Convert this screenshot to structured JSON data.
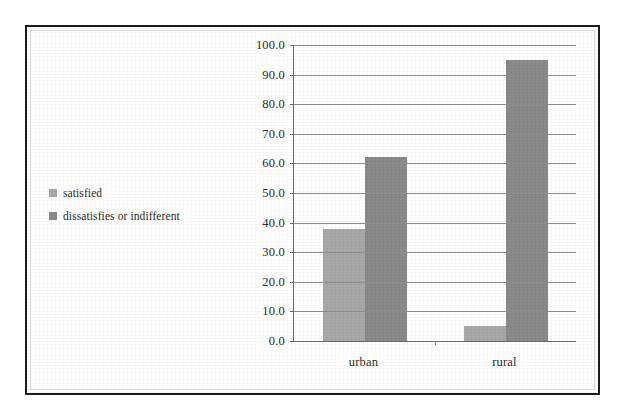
{
  "chart_data": {
    "type": "bar",
    "title": "",
    "subtitle": "",
    "xlabel": "",
    "ylabel": "",
    "categories": [
      "urban",
      "rural"
    ],
    "series": [
      {
        "name": "satisfied",
        "values": [
          38.0,
          5.0
        ],
        "color": "#a8a8a8"
      },
      {
        "name": "dissatisfies or indifferent",
        "values": [
          62.0,
          95.0
        ],
        "color": "#8a8a8a"
      }
    ],
    "ylim": [
      0.0,
      100.0
    ],
    "ytick_step": 10.0,
    "ytick_labels": [
      "100.0",
      "90.0",
      "80.0",
      "70.0",
      "60.0",
      "50.0",
      "40.0",
      "30.0",
      "20.0",
      "10.0",
      "0.0"
    ],
    "ytick_values": [
      100.0,
      90.0,
      80.0,
      70.0,
      60.0,
      50.0,
      40.0,
      30.0,
      20.0,
      10.0,
      0.0
    ],
    "grid": true,
    "grid_axis": "y",
    "legend_position": "left",
    "annotations": []
  },
  "legend": {
    "items": [
      {
        "label": "satisfied",
        "color": "#a8a8a8"
      },
      {
        "label": "dissatisfies or indifferent",
        "color": "#8a8a8a"
      }
    ]
  },
  "colors": {
    "series_light": "#a8a8a8",
    "series_dark": "#8a8a8a",
    "frame": "#1c1c1c",
    "gridline": "#8f8f8f",
    "axis": "#6b6b6b",
    "text": "#2b2b2b",
    "background": "#ffffff"
  }
}
